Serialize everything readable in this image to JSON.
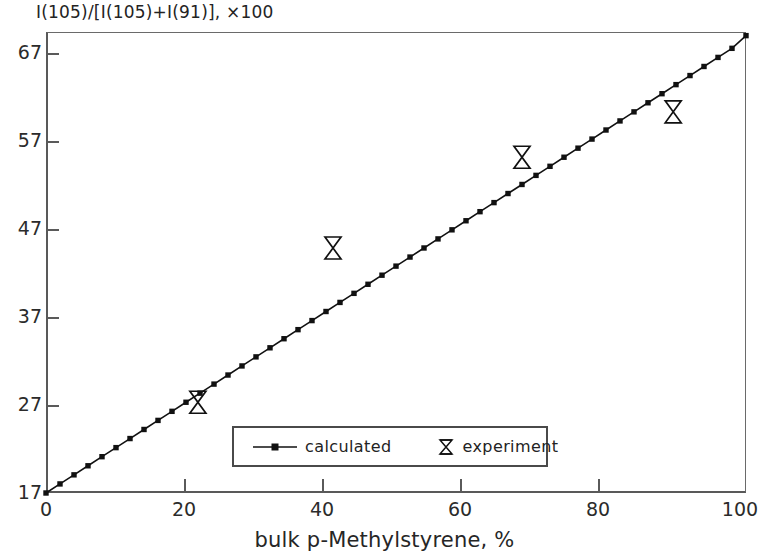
{
  "chart_data": {
    "type": "line",
    "title": "",
    "ylabel": "I(105)/[I(105)+I(91)], ×100",
    "xlabel": "bulk p-Methylstyrene, %",
    "xlim": [
      0,
      100
    ],
    "ylim": [
      17,
      67.8
    ],
    "xticks": [
      0,
      20,
      40,
      60,
      80,
      100
    ],
    "yticks": [
      17,
      27,
      37,
      47,
      57,
      67
    ],
    "xtick_labels": [
      "0",
      "20",
      "40",
      "60",
      "80",
      "100"
    ],
    "ytick_labels": [
      "17",
      "27",
      "37",
      "47",
      "57",
      "67"
    ],
    "grid": false,
    "legend_position": "lower center",
    "series": [
      {
        "name": "calculated",
        "marker": "small-filled-square",
        "style": "line-with-markers",
        "color": "#111111",
        "x": [
          0,
          2,
          4,
          6,
          8,
          10,
          12,
          14,
          16,
          18,
          20,
          22,
          24,
          26,
          28,
          30,
          32,
          34,
          36,
          38,
          40,
          42,
          44,
          46,
          48,
          50,
          52,
          54,
          56,
          58,
          60,
          62,
          64,
          66,
          68,
          70,
          72,
          74,
          76,
          78,
          80,
          82,
          84,
          86,
          88,
          90,
          92,
          94,
          96,
          98,
          100
        ],
        "y": [
          17.0,
          18.0,
          19.0,
          20.0,
          21.0,
          22.0,
          23.0,
          24.0,
          25.0,
          26.0,
          27.0,
          28.0,
          29.0,
          30.0,
          31.0,
          32.0,
          33.0,
          34.0,
          35.0,
          36.0,
          37.0,
          38.0,
          39.0,
          40.0,
          41.0,
          42.0,
          43.0,
          44.0,
          45.0,
          46.0,
          47.0,
          48.0,
          49.0,
          50.0,
          51.0,
          52.0,
          53.0,
          54.0,
          55.0,
          56.0,
          57.0,
          58.0,
          59.0,
          60.0,
          61.0,
          62.0,
          63.0,
          64.0,
          65.0,
          66.0,
          67.4
        ]
      },
      {
        "name": "experiment",
        "marker": "bowtie",
        "style": "markers-only",
        "color": "#111111",
        "x": [
          21.7,
          41.0,
          68.0,
          89.6
        ],
        "y": [
          27.0,
          44.0,
          54.0,
          59.0
        ]
      }
    ]
  },
  "legend": {
    "entries": [
      {
        "label": "calculated",
        "marker": "line-dot-marker"
      },
      {
        "label": "experiment",
        "marker": "bowtie-marker"
      }
    ]
  },
  "colors": {
    "line": "#111111",
    "axis": "#5a5a5a",
    "text": "#232323",
    "background": "#ffffff"
  }
}
